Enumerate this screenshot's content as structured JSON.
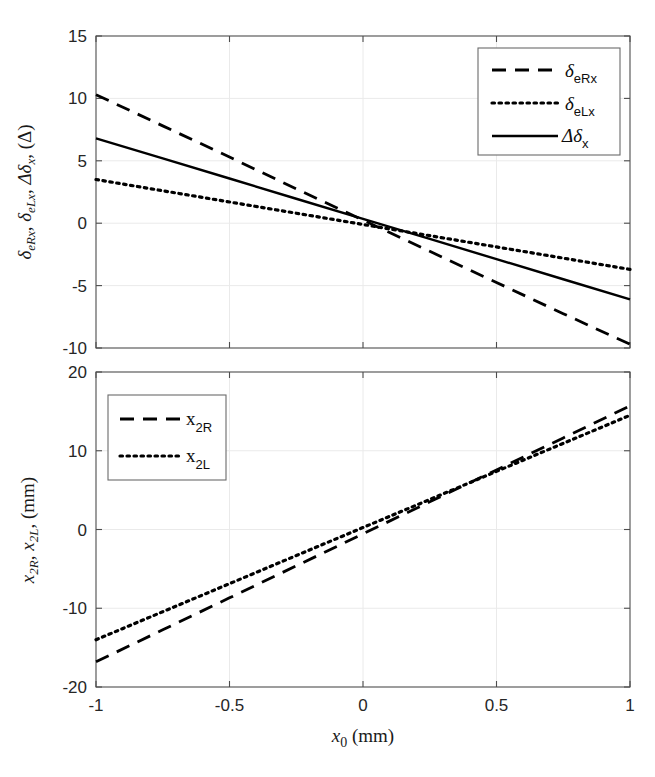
{
  "figure": {
    "title_clipped": "",
    "background": "#ffffff",
    "line_color": "#000000",
    "axis_color": "#4d4d4d",
    "grid_color": "#eaeaea"
  },
  "chart_data": [
    {
      "type": "line",
      "panel": "top",
      "title": "",
      "xlabel": "",
      "ylabel": "δeRx, δeLx, Δδx, (Δ)",
      "ylabel_parts": [
        "δ",
        "eRx",
        ", ",
        "δ",
        "eLx",
        ", ",
        "Δδ",
        "x",
        ", (Δ)"
      ],
      "xlim": [
        -1,
        1
      ],
      "ylim": [
        -10,
        15
      ],
      "xticks": [
        -1,
        -0.5,
        0,
        0.5,
        1
      ],
      "xticklabels": [
        "-1",
        "-0.5",
        "0",
        "0.5",
        "1"
      ],
      "yticks": [
        -10,
        -5,
        0,
        5,
        10,
        15
      ],
      "yticklabels": [
        "-10",
        "-5",
        "0",
        "5",
        "10",
        "15"
      ],
      "grid": true,
      "legend_position": "top-right",
      "x": [
        -1,
        -0.75,
        -0.5,
        -0.25,
        0,
        0.25,
        0.5,
        0.75,
        1
      ],
      "series": [
        {
          "name": "δeRx",
          "label_base": "δ",
          "label_sub": "eRx",
          "style": "dashed",
          "values": [
            10.3,
            7.8,
            5.3,
            2.75,
            0.25,
            -2.25,
            -4.75,
            -7.25,
            -9.7
          ]
        },
        {
          "name": "δeLx",
          "label_base": "δ",
          "label_sub": "eLx",
          "style": "dotted",
          "values": [
            3.5,
            2.6,
            1.7,
            0.8,
            -0.1,
            -1.0,
            -1.9,
            -2.8,
            -3.7
          ]
        },
        {
          "name": "Δδx",
          "label_base": "Δδ",
          "label_sub": "x",
          "style": "solid",
          "values": [
            6.8,
            5.19,
            3.58,
            1.96,
            0.35,
            -1.26,
            -2.88,
            -4.49,
            -6.1
          ]
        }
      ]
    },
    {
      "type": "line",
      "panel": "bottom",
      "title": "",
      "xlabel": "x0 (mm)",
      "xlabel_parts": [
        "x",
        "0",
        " (mm)"
      ],
      "ylabel": "x2R, x2L, (mm)",
      "ylabel_parts": [
        "x",
        "2R",
        ", ",
        "x",
        "2L",
        ", (mm)"
      ],
      "xlim": [
        -1,
        1
      ],
      "ylim": [
        -20,
        20
      ],
      "xticks": [
        -1,
        -0.5,
        0,
        0.5,
        1
      ],
      "xticklabels": [
        "-1",
        "-0.5",
        "0",
        "0.5",
        "1"
      ],
      "yticks": [
        -20,
        -10,
        0,
        10,
        20
      ],
      "yticklabels": [
        "-20",
        "-10",
        "0",
        "10",
        "20"
      ],
      "grid": true,
      "legend_position": "top-left",
      "x": [
        -1,
        -0.75,
        -0.5,
        -0.25,
        0,
        0.25,
        0.5,
        0.75,
        1
      ],
      "series": [
        {
          "name": "x2R",
          "label_base": "x",
          "label_sub": "2R",
          "style": "dashed",
          "values": [
            -16.8,
            -12.74,
            -8.68,
            -4.62,
            -0.55,
            3.51,
            7.57,
            11.63,
            15.7
          ]
        },
        {
          "name": "x2L",
          "label_base": "x",
          "label_sub": "2L",
          "style": "dotted",
          "values": [
            -14.0,
            -10.44,
            -6.88,
            -3.31,
            0.25,
            3.81,
            7.38,
            10.94,
            14.5
          ]
        }
      ]
    }
  ]
}
